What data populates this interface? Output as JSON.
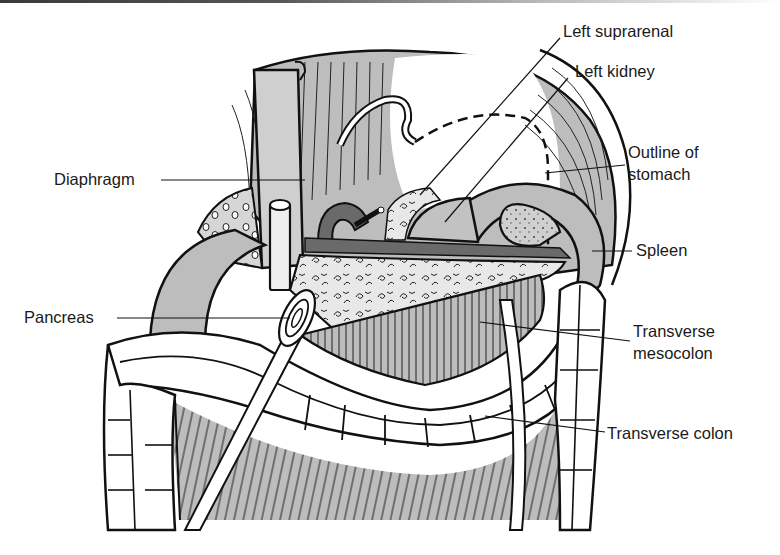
{
  "figure": {
    "labels": {
      "left_suprarenal": "Left suprarenal",
      "left_kidney": "Left kidney",
      "outline_of_stomach_line1": "Outline of",
      "outline_of_stomach_line2": "stomach",
      "diaphragm": "Diaphragm",
      "spleen": "Spleen",
      "pancreas": "Pancreas",
      "transverse_mesocolon_line1": "Transverse",
      "transverse_mesocolon_line2": "mesocolon",
      "transverse_colon": "Transverse colon"
    },
    "colors": {
      "outline": "#111111",
      "tissue_gray": "#b8b8b8",
      "dark_vessel": "#6a6a6a",
      "light_fill": "#e6e6e6",
      "background": "#ffffff"
    }
  }
}
